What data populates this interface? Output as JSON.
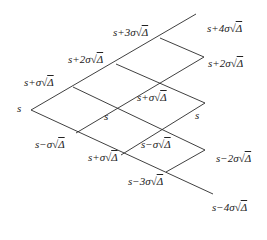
{
  "diagram": {
    "type": "binomial-lattice",
    "line_color": "#2a2a2a",
    "nodes": [
      {
        "id": "n00",
        "x": 31,
        "y": 110
      },
      {
        "id": "n10",
        "x": 73,
        "y": 87
      },
      {
        "id": "n11",
        "x": 76,
        "y": 133
      },
      {
        "id": "n20",
        "x": 116,
        "y": 64
      },
      {
        "id": "n21",
        "x": 115,
        "y": 108
      },
      {
        "id": "n22",
        "x": 121,
        "y": 155
      },
      {
        "id": "n30",
        "x": 160,
        "y": 38
      },
      {
        "id": "n31",
        "x": 158,
        "y": 83
      },
      {
        "id": "n32",
        "x": 162,
        "y": 128
      },
      {
        "id": "n33",
        "x": 166,
        "y": 172
      },
      {
        "id": "n40",
        "x": 196,
        "y": 14
      },
      {
        "id": "n41",
        "x": 204,
        "y": 57
      },
      {
        "id": "n42",
        "x": 205,
        "y": 103
      },
      {
        "id": "n43",
        "x": 205,
        "y": 150
      },
      {
        "id": "n44",
        "x": 213,
        "y": 194
      }
    ],
    "labels": [
      {
        "id": "l-s-root",
        "text": "s",
        "x": 17,
        "y": 102
      },
      {
        "id": "l-s-plus-1",
        "text": "s+σ",
        "rad": "Δ",
        "x": 24,
        "y": 76
      },
      {
        "id": "l-s-minus-1",
        "text": "s−σ",
        "rad": "Δ",
        "x": 35,
        "y": 138
      },
      {
        "id": "l-s-plus-2",
        "text": "s+2σ",
        "rad": "Δ",
        "x": 68,
        "y": 53
      },
      {
        "id": "l-s-mid-2",
        "text": "s",
        "x": 104,
        "y": 110
      },
      {
        "id": "l-s-plus-1b",
        "text": "s+σ",
        "rad": "Δ",
        "x": 88,
        "y": 151
      },
      {
        "id": "l-s-plus-3",
        "text": "s+3σ",
        "rad": "Δ",
        "x": 113,
        "y": 26
      },
      {
        "id": "l-s-plus-1c",
        "text": "s+σ",
        "rad": "Δ",
        "x": 137,
        "y": 91
      },
      {
        "id": "l-s-minus-1b",
        "text": "s−σ",
        "rad": "Δ",
        "x": 141,
        "y": 138
      },
      {
        "id": "l-s-minus-3",
        "text": "s−3σ",
        "rad": "Δ",
        "x": 128,
        "y": 175
      },
      {
        "id": "l-s-plus-4",
        "text": "s+4σ",
        "rad": "Δ",
        "x": 207,
        "y": 22
      },
      {
        "id": "l-s-plus-2b",
        "text": "s+2σ",
        "rad": "Δ",
        "x": 208,
        "y": 57
      },
      {
        "id": "l-s-right",
        "text": "s",
        "x": 195,
        "y": 109
      },
      {
        "id": "l-s-minus-2",
        "text": "s−2σ",
        "rad": "Δ",
        "x": 216,
        "y": 152
      },
      {
        "id": "l-s-minus-4",
        "text": "s−4σ",
        "rad": "Δ",
        "x": 212,
        "y": 201
      }
    ]
  }
}
